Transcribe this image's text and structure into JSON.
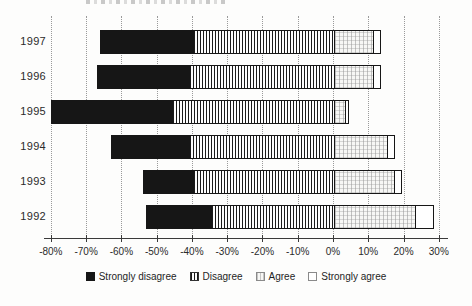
{
  "chart_data": {
    "type": "bar",
    "orientation": "horizontal",
    "stacked": true,
    "diverging": true,
    "title": "",
    "xlabel": "",
    "ylabel": "",
    "categories": [
      "1997",
      "1996",
      "1995",
      "1994",
      "1993",
      "1992"
    ],
    "series": [
      {
        "name": "Strongly disagree",
        "pattern": "solid-black",
        "side": "negative",
        "values": [
          26,
          26,
          34,
          22,
          14,
          18
        ]
      },
      {
        "name": "Disagree",
        "pattern": "vertical-stripes",
        "side": "negative",
        "values": [
          40,
          41,
          46,
          41,
          40,
          35
        ]
      },
      {
        "name": "Agree",
        "pattern": "light-grid",
        "side": "positive",
        "values": [
          11,
          11,
          3,
          15,
          17,
          23
        ]
      },
      {
        "name": "Strongly agree",
        "pattern": "white",
        "side": "positive",
        "values": [
          2,
          2,
          1,
          2,
          2,
          5
        ]
      }
    ],
    "x_ticks": [
      "-80%",
      "-70%",
      "-60%",
      "-50%",
      "-40%",
      "-30%",
      "-20%",
      "-10%",
      "0%",
      "10%",
      "20%",
      "30%"
    ],
    "x_tick_values": [
      -80,
      -70,
      -60,
      -50,
      -40,
      -30,
      -20,
      -10,
      0,
      10,
      20,
      30
    ],
    "xlim": [
      -80,
      30
    ],
    "grid": "dotted-vertical",
    "legend_position": "bottom",
    "legend": [
      "Strongly disagree",
      "Disagree",
      "Agree",
      "Strongly agree"
    ]
  },
  "colors": {
    "background": "#fdfdfc",
    "bar_fill_black": "#161616",
    "bar_outline": "#161616",
    "gridline": "#9a9a9a",
    "axis": "#3a3a3a",
    "text": "#2b2b2b"
  }
}
